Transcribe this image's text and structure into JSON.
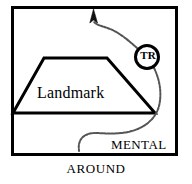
{
  "figure": {
    "caption": "AROUND",
    "frame": {
      "shape_name": "rectangle-border",
      "stroke_color": "#000000",
      "stroke_width": 3,
      "x": 11,
      "y": 6,
      "width": 167,
      "height": 150
    },
    "shapes": [
      {
        "id": "landmark-trapezoid",
        "type": "trapezoid",
        "label": "Landmark",
        "stroke_color": "#000000",
        "fill_color": "#ffffff",
        "stroke_width": 3,
        "points": "44,58 107,58 155,113 13,113"
      }
    ],
    "nodes": [
      {
        "id": "tr-node",
        "type": "circle",
        "label": "TR",
        "cx": 147,
        "cy": 57,
        "r": 12,
        "stroke_color": "#000000",
        "stroke_width": 3,
        "fill_color": "#ffffff"
      }
    ],
    "connectors": [
      {
        "id": "arrow-connector-up",
        "style": "squiggly",
        "arrowhead": "up",
        "stroke_color": "#555555",
        "from": "tr-node",
        "to": "arrow-tip"
      },
      {
        "id": "squiggle-connector-down",
        "style": "squiggly",
        "arrowhead": "none",
        "stroke_color": "#555555",
        "from": "tr-node",
        "to": "mental-label"
      }
    ],
    "labels": {
      "landmark": "Landmark",
      "mental": "MENTAL",
      "tr": "TR",
      "around": "AROUND"
    },
    "colors": {
      "ink": "#000000",
      "squiggle": "#555555",
      "background": "#ffffff"
    }
  }
}
